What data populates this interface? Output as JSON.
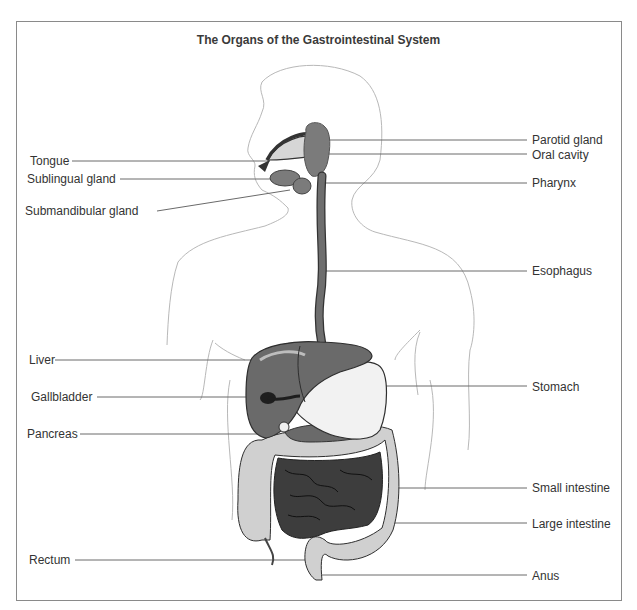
{
  "diagram": {
    "title": "The Organs of the Gastrointestinal System",
    "labels_left": [
      {
        "id": "tongue",
        "text": "Tongue",
        "x": 30,
        "y": 154
      },
      {
        "id": "sublingual-gland",
        "text": "Sublingual gland",
        "x": 27,
        "y": 172
      },
      {
        "id": "submandibular-gland",
        "text": "Submandibular gland",
        "x": 25,
        "y": 204
      },
      {
        "id": "liver",
        "text": "Liver",
        "x": 29,
        "y": 353
      },
      {
        "id": "gallbladder",
        "text": "Gallbladder",
        "x": 31,
        "y": 390
      },
      {
        "id": "pancreas",
        "text": "Pancreas",
        "x": 27,
        "y": 427
      },
      {
        "id": "rectum",
        "text": "Rectum",
        "x": 29,
        "y": 553
      }
    ],
    "labels_right": [
      {
        "id": "parotid-gland",
        "text": "Parotid gland",
        "y": 133
      },
      {
        "id": "oral-cavity",
        "text": "Oral cavity",
        "y": 148
      },
      {
        "id": "pharynx",
        "text": "Pharynx",
        "y": 176
      },
      {
        "id": "esophagus",
        "text": "Esophagus",
        "y": 264
      },
      {
        "id": "stomach",
        "text": "Stomach",
        "y": 380
      },
      {
        "id": "small-intestine",
        "text": "Small intestine",
        "y": 481
      },
      {
        "id": "large-intestine",
        "text": "Large intestine",
        "y": 517
      },
      {
        "id": "anus",
        "text": "Anus",
        "y": 569
      }
    ],
    "colors": {
      "frame": "#8a8a8a",
      "outline": "#b5b5b5",
      "leader": "#666666",
      "organ_dark": "#5f5f5f",
      "organ_mid": "#7a7a7a",
      "organ_light": "#cfcfcf",
      "small_intestine": "#3d3d3d"
    }
  }
}
